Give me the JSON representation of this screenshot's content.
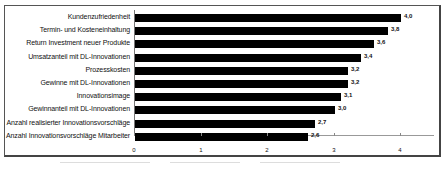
{
  "chart_data": {
    "type": "bar",
    "orientation": "horizontal",
    "title": "",
    "xlabel": "",
    "ylabel": "",
    "xlim": [
      0,
      4.4
    ],
    "x_ticks": [
      "0",
      "1",
      "2",
      "3",
      "4"
    ],
    "grid": false,
    "legend": null,
    "bar_color": "#000000",
    "categories": [
      "Kundenzufriedenheit",
      "Termin- und Kosteneinhaltung",
      "Return Investment neuer Produkte",
      "Umsatzanteil mit DL-Innovationen",
      "Prozesskosten",
      "Gewinne mit DL-Innovationen",
      "Innovationsimage",
      "Gewinnanteil mit DL-Innovationen",
      "Anzahl realisierter Innovationsvorschläge",
      "Anzahl Innovationsvorschläge Mitarbeiter"
    ],
    "values": [
      4.0,
      3.8,
      3.6,
      3.4,
      3.2,
      3.2,
      3.1,
      3.0,
      2.7,
      2.6
    ],
    "value_labels": [
      "4,0",
      "3,8",
      "3,6",
      "3,4",
      "3,2",
      "3,2",
      "3,1",
      "3,0",
      "2,7",
      "2,6"
    ]
  }
}
